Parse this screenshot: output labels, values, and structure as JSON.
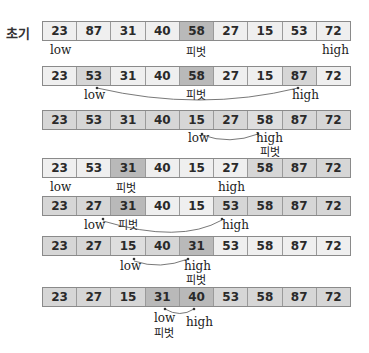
{
  "initial_label": "초기",
  "pointer_labels": {
    "low": "low",
    "high": "high",
    "pivot": "피벗"
  },
  "rows": [
    {
      "values": [
        "23",
        "87",
        "31",
        "40",
        "58",
        "27",
        "15",
        "53",
        "72"
      ],
      "shades": [
        "light",
        "light",
        "light",
        "light",
        "dark",
        "light",
        "light",
        "light",
        "light"
      ]
    },
    {
      "values": [
        "23",
        "53",
        "31",
        "40",
        "58",
        "27",
        "15",
        "87",
        "72"
      ],
      "shades": [
        "light",
        "mid",
        "light",
        "light",
        "dark",
        "light",
        "light",
        "mid",
        "light"
      ]
    },
    {
      "values": [
        "23",
        "53",
        "31",
        "40",
        "15",
        "27",
        "58",
        "87",
        "72"
      ],
      "shades": [
        "mid",
        "mid",
        "mid",
        "mid",
        "mid",
        "mid",
        "midlight",
        "mid",
        "mid"
      ]
    },
    {
      "values": [
        "23",
        "53",
        "31",
        "40",
        "15",
        "27",
        "58",
        "87",
        "72"
      ],
      "shades": [
        "light",
        "light",
        "dark",
        "light",
        "light",
        "light",
        "mid",
        "mid",
        "mid"
      ]
    },
    {
      "values": [
        "23",
        "27",
        "31",
        "40",
        "15",
        "53",
        "58",
        "87",
        "72"
      ],
      "shades": [
        "mid",
        "mid",
        "dark",
        "light",
        "light",
        "mid",
        "mid",
        "mid",
        "mid"
      ]
    },
    {
      "values": [
        "23",
        "27",
        "15",
        "40",
        "31",
        "53",
        "58",
        "87",
        "72"
      ],
      "shades": [
        "mid",
        "mid",
        "midlight",
        "mid",
        "dark",
        "light",
        "light",
        "light",
        "light"
      ]
    },
    {
      "values": [
        "23",
        "27",
        "15",
        "31",
        "40",
        "53",
        "58",
        "87",
        "72"
      ],
      "shades": [
        "mid",
        "mid",
        "mid",
        "dark",
        "dark",
        "mid",
        "mid",
        "mid",
        "mid"
      ]
    }
  ]
}
